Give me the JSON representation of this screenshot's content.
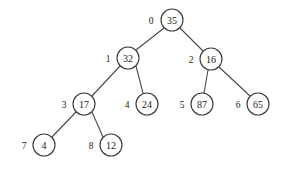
{
  "figure": {
    "type": "binary-tree-diagram",
    "width": 282,
    "height": 170,
    "background_color": "#ffffff",
    "node_stroke_color": "#3d3d3d",
    "edge_stroke_color": "#4a4a4a",
    "text_color": "#1a1a1a",
    "node_radius": 11
  },
  "nodes": [
    {
      "index": "0",
      "value": "35",
      "cx": 172,
      "cy": 20,
      "index_x": 151,
      "index_y": 20
    },
    {
      "index": "1",
      "value": "32",
      "cx": 128,
      "cy": 58,
      "index_x": 108,
      "index_y": 58
    },
    {
      "index": "2",
      "value": "16",
      "cx": 211,
      "cy": 59,
      "index_x": 191,
      "index_y": 59
    },
    {
      "index": "3",
      "value": "17",
      "cx": 84,
      "cy": 104,
      "index_x": 64,
      "index_y": 104
    },
    {
      "index": "4",
      "value": "24",
      "cx": 147,
      "cy": 104,
      "index_x": 127,
      "index_y": 104
    },
    {
      "index": "5",
      "value": "87",
      "cx": 202,
      "cy": 104,
      "index_x": 182,
      "index_y": 104
    },
    {
      "index": "6",
      "value": "65",
      "cx": 258,
      "cy": 104,
      "index_x": 238,
      "index_y": 104
    },
    {
      "index": "7",
      "value": "4",
      "cx": 44,
      "cy": 145,
      "index_x": 24,
      "index_y": 145
    },
    {
      "index": "8",
      "value": "12",
      "cx": 111,
      "cy": 145,
      "index_x": 91,
      "index_y": 145
    }
  ],
  "edges": [
    {
      "from": "0",
      "to": "1",
      "x1": 164,
      "y1": 28,
      "x2": 136,
      "y2": 50
    },
    {
      "from": "0",
      "to": "2",
      "x1": 180,
      "y1": 28,
      "x2": 203,
      "y2": 51
    },
    {
      "from": "1",
      "to": "3",
      "x1": 120,
      "y1": 66,
      "x2": 92,
      "y2": 96
    },
    {
      "from": "1",
      "to": "4",
      "x1": 136,
      "y1": 66,
      "x2": 143,
      "y2": 93
    },
    {
      "from": "2",
      "to": "5",
      "x1": 208,
      "y1": 70,
      "x2": 204,
      "y2": 93
    },
    {
      "from": "2",
      "to": "6",
      "x1": 219,
      "y1": 67,
      "x2": 250,
      "y2": 96
    },
    {
      "from": "3",
      "to": "7",
      "x1": 76,
      "y1": 112,
      "x2": 52,
      "y2": 137
    },
    {
      "from": "3",
      "to": "8",
      "x1": 92,
      "y1": 112,
      "x2": 103,
      "y2": 137
    }
  ]
}
